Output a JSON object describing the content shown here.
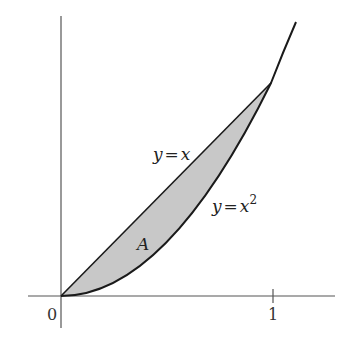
{
  "figure": {
    "type": "area-between-curves",
    "curves": [
      {
        "name": "line",
        "label": "y = x",
        "expr": "x"
      },
      {
        "name": "parabola",
        "label": "y = x²",
        "expr": "x^2"
      }
    ],
    "region_label": "A",
    "x_ticks": [
      {
        "value": 0,
        "label": "0"
      },
      {
        "value": 1,
        "label": "1"
      }
    ],
    "colors": {
      "fill": "#c8c8c8",
      "curve": "#1a1a1a",
      "axis": "#555555"
    }
  },
  "labels": {
    "line_lhs": "y",
    "line_eq": "=",
    "line_rhs": "x",
    "parabola_lhs": "y",
    "parabola_eq": "=",
    "parabola_rhs": "x",
    "parabola_exp": "2",
    "region": "A",
    "tick_0": "0",
    "tick_1": "1"
  }
}
